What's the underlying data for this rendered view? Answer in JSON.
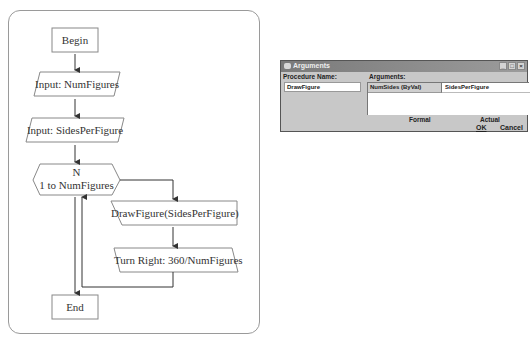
{
  "flowchart": {
    "begin": "Begin",
    "input1": "Input: NumFigures",
    "input2": "Input: SidesPerFigure",
    "loop_var": "N",
    "loop_range": "1 to NumFigures",
    "draw": "DrawFigure(SidesPerFigure)",
    "turn": "Turn Right: 360/NumFigures",
    "end": "End"
  },
  "dialog": {
    "title": "Arguments",
    "procedure_label": "Procedure Name:",
    "procedure_value": "DrawFigure",
    "arguments_label": "Arguments:",
    "arguments": [
      {
        "formal": "NumSides (ByVal)",
        "actual": "SidesPerFigure"
      }
    ],
    "formal_label": "Formal",
    "actual_label": "Actual",
    "ok_label": "OK",
    "cancel_label": "Cancel",
    "window_controls": [
      "minimize-icon",
      "maximize-icon",
      "close-icon"
    ]
  }
}
